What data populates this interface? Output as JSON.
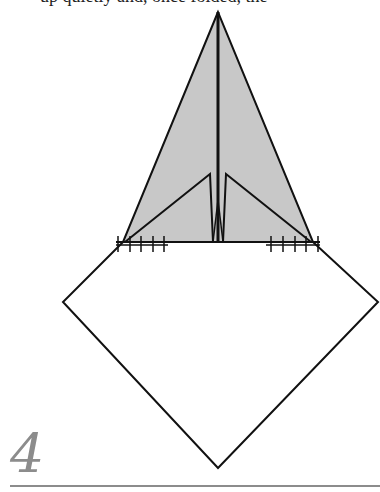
{
  "caption_fragment": "up quietly and, once folded, the",
  "step": {
    "number": "4"
  },
  "colors": {
    "shaded": "#c8c8c8",
    "line": "#111111",
    "step_number": "#8c8c8c",
    "rule": "#8c8c8c"
  }
}
